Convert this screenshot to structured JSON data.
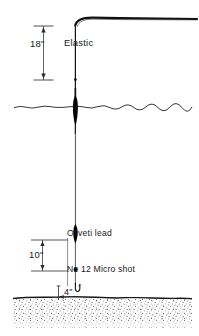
{
  "diagram": {
    "type": "technical-line-illustration",
    "colors": {
      "ink": "#1a1a1a",
      "line": "#111111",
      "background": "#ffffff",
      "seabed_stipple": "#3a3a3a"
    },
    "labels": {
      "elastic": "Elastic",
      "dim_elastic": "18\"",
      "dim_shot_gap": "10\"",
      "dim_hook_clearance": "4\"",
      "oliveti_lead": "Oliveti lead",
      "micro_shot": "No 12 Micro shot"
    },
    "components": [
      {
        "name": "pole-tip",
        "label": ""
      },
      {
        "name": "elastic-section",
        "label": "Elastic",
        "measurement": "18\""
      },
      {
        "name": "float",
        "label": ""
      },
      {
        "name": "water-surface",
        "label": ""
      },
      {
        "name": "main-line",
        "label": ""
      },
      {
        "name": "oliveti-lead",
        "label": "Oliveti lead"
      },
      {
        "name": "micro-shot",
        "label": "No 12 Micro shot",
        "measurement": "10\""
      },
      {
        "name": "hook",
        "label": "",
        "measurement": "4\""
      },
      {
        "name": "seabed",
        "label": ""
      }
    ]
  }
}
